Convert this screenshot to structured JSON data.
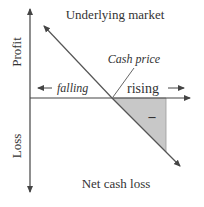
{
  "diagram": {
    "title_top": "Underlying market",
    "title_bottom": "Net cash loss",
    "y_axis_top_label": "Profit",
    "y_axis_bottom_label": "Loss",
    "line_label": "Cash price",
    "direction_left": "falling",
    "direction_right": "rising",
    "region_sign": "–",
    "colors": {
      "line": "#555555",
      "shade": "#c8c8c8",
      "text": "#333333"
    }
  }
}
